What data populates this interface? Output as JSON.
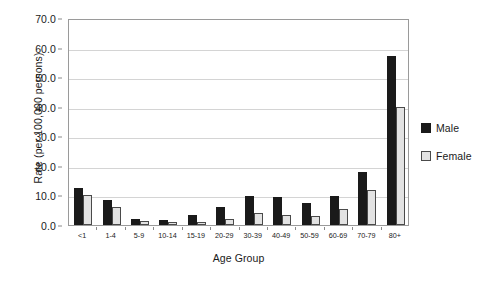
{
  "chart_data": {
    "type": "bar",
    "title": "",
    "xlabel": "Age Group",
    "ylabel": "Rate (per 100,000 persons)",
    "categories": [
      "<1",
      "1-4",
      "5-9",
      "10-14",
      "15-19",
      "20-29",
      "30-39",
      "40-49",
      "50-59",
      "60-69",
      "70-79",
      "80+"
    ],
    "series": [
      {
        "name": "Male",
        "color": "#1a1a1a",
        "values": [
          12.5,
          8.6,
          2.0,
          1.7,
          3.3,
          6.0,
          9.8,
          9.6,
          7.6,
          9.9,
          17.9,
          57.0
        ]
      },
      {
        "name": "Female",
        "color": "#e3e3e3",
        "values": [
          10.0,
          6.0,
          1.5,
          1.0,
          1.0,
          2.2,
          4.0,
          3.3,
          3.2,
          5.4,
          12.0,
          40.0
        ]
      }
    ],
    "ylim": [
      0,
      70
    ],
    "yticks": [
      "0.0",
      "10.0",
      "20.0",
      "30.0",
      "40.0",
      "50.0",
      "60.0",
      "70.0"
    ],
    "ytick_values": [
      0,
      10,
      20,
      30,
      40,
      50,
      60,
      70
    ],
    "grid": true,
    "legend_position": "right",
    "legend": [
      "Male",
      "Female"
    ]
  }
}
